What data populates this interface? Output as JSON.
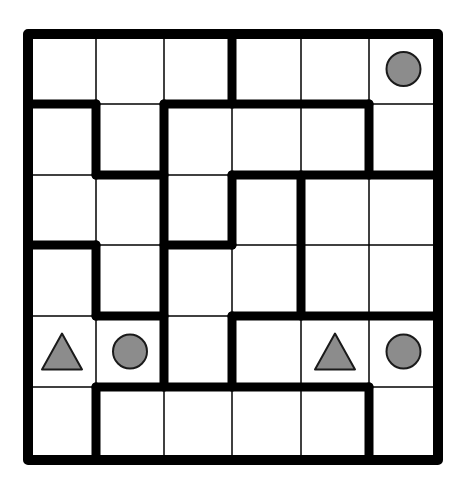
{
  "puzzle": {
    "rows": 6,
    "cols": 6,
    "colors": {
      "background": "#ffffff",
      "line": "#000000",
      "shape_fill": "#8c8c8c",
      "shape_stroke": "#1a1a1a"
    },
    "x_lines": [
      28,
      96,
      164,
      232,
      301,
      369,
      438
    ],
    "y_lines": [
      34,
      104,
      175,
      245,
      316,
      387,
      460
    ],
    "thick_walls": [
      {
        "orient": "h",
        "y": 1,
        "x0": 0,
        "x1": 1
      },
      {
        "orient": "h",
        "y": 1,
        "x0": 2,
        "x1": 5
      },
      {
        "orient": "v",
        "x": 3,
        "y0": 0,
        "y1": 1
      },
      {
        "orient": "v",
        "x": 1,
        "y0": 1,
        "y1": 2
      },
      {
        "orient": "h",
        "y": 2,
        "x0": 1,
        "x1": 2
      },
      {
        "orient": "v",
        "x": 2,
        "y0": 1,
        "y1": 5
      },
      {
        "orient": "v",
        "x": 5,
        "y0": 1,
        "y1": 2
      },
      {
        "orient": "h",
        "y": 2,
        "x0": 3,
        "x1": 6
      },
      {
        "orient": "v",
        "x": 3,
        "y0": 2,
        "y1": 3
      },
      {
        "orient": "h",
        "y": 3,
        "x0": 2,
        "x1": 3
      },
      {
        "orient": "v",
        "x": 4,
        "y0": 2,
        "y1": 4
      },
      {
        "orient": "h",
        "y": 3,
        "x0": 0,
        "x1": 1
      },
      {
        "orient": "v",
        "x": 1,
        "y0": 3,
        "y1": 4
      },
      {
        "orient": "h",
        "y": 4,
        "x0": 1,
        "x1": 2
      },
      {
        "orient": "h",
        "y": 4,
        "x0": 3,
        "x1": 6
      },
      {
        "orient": "v",
        "x": 3,
        "y0": 4,
        "y1": 5
      },
      {
        "orient": "h",
        "y": 5,
        "x0": 1,
        "x1": 5
      },
      {
        "orient": "v",
        "x": 1,
        "y0": 5,
        "y1": 6
      },
      {
        "orient": "v",
        "x": 5,
        "y0": 5,
        "y1": 6
      }
    ],
    "shapes": [
      {
        "type": "circle",
        "row": 0,
        "col": 5
      },
      {
        "type": "triangle",
        "row": 4,
        "col": 0
      },
      {
        "type": "circle",
        "row": 4,
        "col": 1
      },
      {
        "type": "triangle",
        "row": 4,
        "col": 4
      },
      {
        "type": "circle",
        "row": 4,
        "col": 5
      }
    ]
  }
}
